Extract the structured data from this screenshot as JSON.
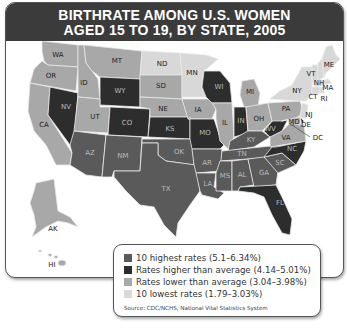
{
  "title": {
    "line1": "BIRTHRATE AMONG U.S. WOMEN",
    "line2": "AGED 15 TO 19, BY STATE, 2005"
  },
  "colors": {
    "header": "#3b3b3b",
    "highest": "#5a5a5a",
    "higher": "#2d2d2d",
    "lower": "#a8a8a8",
    "lowest": "#d8d8d8"
  },
  "legend": {
    "items": [
      {
        "label": "10 highest rates (5.1–6.34%)",
        "category": "highest"
      },
      {
        "label": "Rates higher than average (4.14–5.01%)",
        "category": "higher"
      },
      {
        "label": "Rates lower than average (3.04–3.98%)",
        "category": "lower"
      },
      {
        "label": "10 lowest rates (1.79–3.03%)",
        "category": "lowest"
      }
    ],
    "source": "Source: CDC/NCHS, National Vital Statistics System"
  },
  "map_data": {
    "type": "choropleth",
    "title": "Birthrate among U.S. women aged 15 to 19, by state, 2005",
    "states": {
      "WA": "lower",
      "OR": "lower",
      "CA": "lower",
      "ID": "lower",
      "MT": "lower",
      "NV": "higher",
      "UT": "lower",
      "WY": "higher",
      "CO": "higher",
      "AZ": "highest",
      "NM": "highest",
      "ND": "lowest",
      "SD": "lower",
      "NE": "lower",
      "KS": "higher",
      "OK": "highest",
      "TX": "highest",
      "MN": "lowest",
      "IA": "lower",
      "MO": "higher",
      "AR": "highest",
      "LA": "highest",
      "WI": "higher",
      "IL": "lower",
      "MI": "lower",
      "IN": "higher",
      "OH": "lower",
      "KY": "highest",
      "TN": "highest",
      "MS": "highest",
      "AL": "highest",
      "GA": "highest",
      "FL": "higher",
      "SC": "highest",
      "NC": "higher",
      "VA": "lower",
      "WV": "higher",
      "PA": "lower",
      "NY": "lowest",
      "VT": "lowest",
      "NH": "lowest",
      "ME": "lowest",
      "MA": "lowest",
      "CT": "lowest",
      "RI": "lowest",
      "NJ": "lowest",
      "DE": "higher",
      "MD": "lower",
      "DC": "lower",
      "AK": "lower",
      "HI": "lower"
    }
  },
  "labels": {
    "WA": "WA",
    "OR": "OR",
    "CA": "CA",
    "ID": "ID",
    "MT": "MT",
    "NV": "NV",
    "UT": "UT",
    "WY": "WY",
    "CO": "CO",
    "AZ": "AZ",
    "NM": "NM",
    "ND": "ND",
    "SD": "SD",
    "NE": "NE",
    "KS": "KS",
    "OK": "OK",
    "TX": "TX",
    "MN": "MN",
    "IA": "IA",
    "MO": "MO",
    "AR": "AR",
    "LA": "LA",
    "WI": "WI",
    "IL": "IL",
    "MI": "MI",
    "IN": "IN",
    "OH": "OH",
    "KY": "KY",
    "TN": "TN",
    "MS": "MS",
    "AL": "AL",
    "GA": "GA",
    "FL": "FL",
    "SC": "SC",
    "NC": "NC",
    "VA": "VA",
    "WV": "WV",
    "PA": "PA",
    "NY": "NY",
    "VT": "VT",
    "NH": "NH",
    "ME": "ME",
    "MA": "MA",
    "CT": "CT",
    "RI": "RI",
    "NJ": "NJ",
    "DE": "DE",
    "MD": "MD",
    "DC": "DC",
    "AK": "AK",
    "HI": "HI"
  }
}
